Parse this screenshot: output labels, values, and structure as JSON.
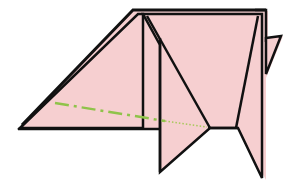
{
  "diagram": {
    "type": "origami-fold-step",
    "colors": {
      "paper": "#f6cfd0",
      "paper_back": "#f3c4c6",
      "outline": "#111111",
      "fold_line": "#8fc34a",
      "background": "#ffffff"
    },
    "fold_line": {
      "style": "dash-dot then dotted",
      "meaning": "valley/mountain fold guide",
      "from": [
        55,
        103
      ],
      "to": [
        208,
        128
      ]
    }
  }
}
